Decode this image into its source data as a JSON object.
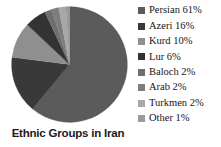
{
  "chart_data": {
    "type": "pie",
    "title": "Ethnic Groups in Iran",
    "categories": [
      "Persian",
      "Azeri",
      "Kurd",
      "Lur",
      "Baloch",
      "Arab",
      "Turkmen",
      "Other"
    ],
    "values": [
      61,
      16,
      10,
      6,
      2,
      2,
      2,
      1
    ],
    "value_unit": "%",
    "labels": [
      "Persian 61%",
      "Azeri 16%",
      "Kurd 10%",
      "Lur 6%",
      "Baloch 2%",
      "Arab 2%",
      "Turkmen 2%",
      "Other 1%"
    ],
    "colors": [
      "#5b5b5b",
      "#393939",
      "#8f8f8f",
      "#333333",
      "#6e6e6e",
      "#7d7d7d",
      "#a8a8a8",
      "#9a9a9a"
    ],
    "legend_position": "right",
    "grid": false,
    "xlabel": "",
    "ylabel": "",
    "start_angle_deg": 0,
    "direction": "clockwise"
  },
  "legend": {
    "items": [
      {
        "label": "Persian 61%",
        "color": "#5b5b5b"
      },
      {
        "label": "Azeri 16%",
        "color": "#393939"
      },
      {
        "label": "Kurd 10%",
        "color": "#8f8f8f"
      },
      {
        "label": "Lur 6%",
        "color": "#333333"
      },
      {
        "label": "Baloch 2%",
        "color": "#6e6e6e"
      },
      {
        "label": "Arab 2%",
        "color": "#7d7d7d"
      },
      {
        "label": "Turkmen 2%",
        "color": "#a8a8a8"
      },
      {
        "label": "Other 1%",
        "color": "#9a9a9a"
      }
    ]
  },
  "title": {
    "text": "Ethnic Groups in Iran"
  }
}
